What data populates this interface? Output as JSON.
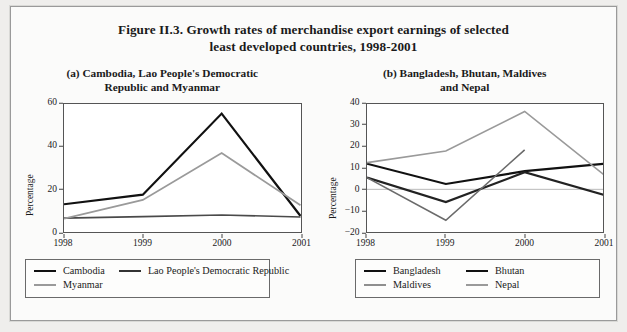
{
  "figure": {
    "title_line1": "Figure II.3.  Growth rates of merchandise export earnings of selected",
    "title_line2": "least developed countries, 1998-2001"
  },
  "panel_a": {
    "title_line1": "(a)  Cambodia, Lao People's Democratic",
    "title_line2": "Republic and Myanmar"
  },
  "panel_b": {
    "title_line1": "(b)  Bangladesh, Bhutan, Maldives",
    "title_line2": "and Nepal"
  },
  "colors": {
    "black": "#111111",
    "dark_gray": "#6b6b6b",
    "mid_gray": "#8f8f8f",
    "light_gray": "#a6a6a6",
    "axis": "#555555",
    "page_bg": "#fbfbfa",
    "outer_bg": "#efeeec"
  },
  "chart_data": [
    {
      "type": "line",
      "title": "(a)  Cambodia, Lao People's Democratic Republic and Myanmar",
      "xlabel": "",
      "ylabel": "Percentage",
      "x": [
        "1998",
        "1999",
        "2000",
        "2001"
      ],
      "xticklabels": [
        "1998",
        "1999",
        "2000",
        "2001"
      ],
      "yticklabels": [
        "0",
        "20",
        "40",
        "60"
      ],
      "ylim": [
        0,
        60
      ],
      "yticks": [
        0,
        20,
        40,
        60
      ],
      "grid": false,
      "legend_position": "below",
      "series": [
        {
          "name": "Cambodia",
          "color": "#111111",
          "width": 2.2,
          "values": [
            13,
            17.5,
            55.5,
            7.5
          ]
        },
        {
          "name": "Lao People's Democratic Republic",
          "color": "#4a4a4a",
          "width": 1.6,
          "values": [
            6.5,
            7.2,
            8.0,
            7.0
          ]
        },
        {
          "name": "Myanmar",
          "color": "#9a9a9a",
          "width": 1.8,
          "values": [
            6.3,
            15.0,
            37.0,
            12.5
          ]
        }
      ]
    },
    {
      "type": "line",
      "title": "(b)  Bangladesh, Bhutan, Maldives and Nepal",
      "xlabel": "",
      "ylabel": "Percentage",
      "x": [
        "1998",
        "1999",
        "2000",
        "2001"
      ],
      "xticklabels": [
        "1998",
        "1999",
        "2000",
        "2001"
      ],
      "yticklabels": [
        "-20",
        "-10",
        "0",
        "10",
        "20",
        "30",
        "40"
      ],
      "ylim": [
        -20,
        40
      ],
      "yticks": [
        -20,
        -10,
        0,
        10,
        20,
        30,
        40
      ],
      "grid": false,
      "zero_line": true,
      "legend_position": "below",
      "series": [
        {
          "name": "Bangladesh",
          "color": "#111111",
          "width": 2.2,
          "values": [
            12,
            2.5,
            8.5,
            12
          ]
        },
        {
          "name": "Bhutan",
          "color": "#222222",
          "width": 2.2,
          "values": [
            5.5,
            -6.0,
            8.0,
            -2.5
          ]
        },
        {
          "name": "Maldives",
          "color": "#9a9a9a",
          "width": 1.6,
          "values": [
            12.5,
            18.0,
            36.5,
            7.0
          ]
        },
        {
          "name": "Nepal",
          "color": "#6b6b6b",
          "width": 1.6,
          "values": [
            5.5,
            -14.5,
            18.5,
            null
          ]
        }
      ]
    }
  ],
  "legend_a": {
    "items": [
      {
        "label": "Cambodia",
        "color": "#111111",
        "width": 2.4
      },
      {
        "label": "Lao People's Democratic Republic",
        "color": "#333333",
        "width": 2.4
      },
      {
        "label": "Myanmar",
        "color": "#9a9a9a",
        "width": 2.0
      }
    ]
  },
  "legend_b": {
    "items": [
      {
        "label": "Bangladesh",
        "color": "#111111",
        "width": 2.4
      },
      {
        "label": "Bhutan",
        "color": "#111111",
        "width": 2.4
      },
      {
        "label": "Maldives",
        "color": "#8f8f8f",
        "width": 2.0
      },
      {
        "label": "Nepal",
        "color": "#9a9a9a",
        "width": 2.0
      }
    ]
  }
}
